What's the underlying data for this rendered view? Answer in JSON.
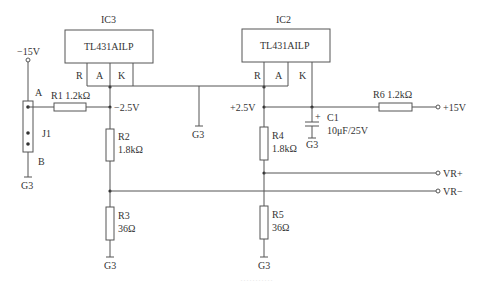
{
  "diagram": {
    "type": "circuit-schematic",
    "accent_color": "#555555",
    "ics": [
      {
        "ref": "IC3",
        "part": "TL431AILP",
        "pins": [
          "R",
          "A",
          "K"
        ]
      },
      {
        "ref": "IC2",
        "part": "TL431AILP",
        "pins": [
          "R",
          "A",
          "K"
        ]
      }
    ],
    "resistors": [
      {
        "ref": "R1",
        "value": "1.2kΩ",
        "label": "R1 1.2kΩ"
      },
      {
        "ref": "R2",
        "value": "1.8kΩ"
      },
      {
        "ref": "R3",
        "value": "36Ω"
      },
      {
        "ref": "R4",
        "value": "1.8kΩ"
      },
      {
        "ref": "R5",
        "value": "36Ω"
      },
      {
        "ref": "R6",
        "value": "1.2kΩ",
        "label": "R6 1.2kΩ"
      }
    ],
    "capacitor": {
      "ref": "C1",
      "value": "10μF/25V",
      "polarity": "+"
    },
    "jumper": {
      "ref": "J1",
      "pin_a": "A",
      "pin_b": "B"
    },
    "nets": {
      "neg_supply": "−15V",
      "pos_supply": "+15V",
      "neg_ref": "−2.5V",
      "pos_ref": "+2.5V",
      "vr_plus": "VR+",
      "vr_minus": "VR−",
      "ground": "G3"
    },
    "caption": "···········"
  }
}
